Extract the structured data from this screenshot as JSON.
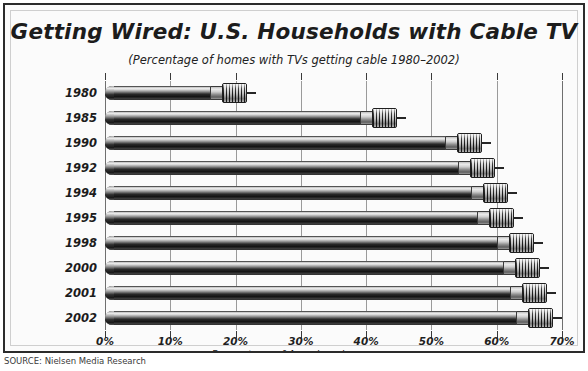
{
  "chart_data": {
    "type": "bar",
    "orientation": "horizontal",
    "title": "Getting Wired: U.S. Households with Cable TV",
    "subtitle": "(Percentage of homes with TVs getting cable 1980–2002)",
    "xlabel": "Percentage of American homes",
    "ylabel": "",
    "xlim": [
      0,
      70
    ],
    "xticks": [
      0,
      10,
      20,
      30,
      40,
      50,
      60,
      70
    ],
    "xticklabels": [
      "0%",
      "10%",
      "20%",
      "30%",
      "40%",
      "50%",
      "60%",
      "70%"
    ],
    "grid": true,
    "legend": false,
    "categories": [
      "1980",
      "1985",
      "1990",
      "1992",
      "1994",
      "1995",
      "1998",
      "2000",
      "2001",
      "2002"
    ],
    "values": [
      20,
      43,
      56,
      58,
      60,
      61,
      64,
      65,
      66,
      67
    ],
    "series": [
      {
        "name": "Percentage of homes with TVs getting cable",
        "values": [
          20,
          43,
          56,
          58,
          60,
          61,
          64,
          65,
          66,
          67
        ]
      }
    ],
    "source": "SOURCE: Nielsen Media Research",
    "colors": {
      "bar_dark": "#141414",
      "bar_light": "#f1f1f1",
      "frame_border": "#2b2b2b",
      "grid": "#9a9a9a",
      "background": "#fbfbfb",
      "text": "#1c1c1c"
    }
  }
}
